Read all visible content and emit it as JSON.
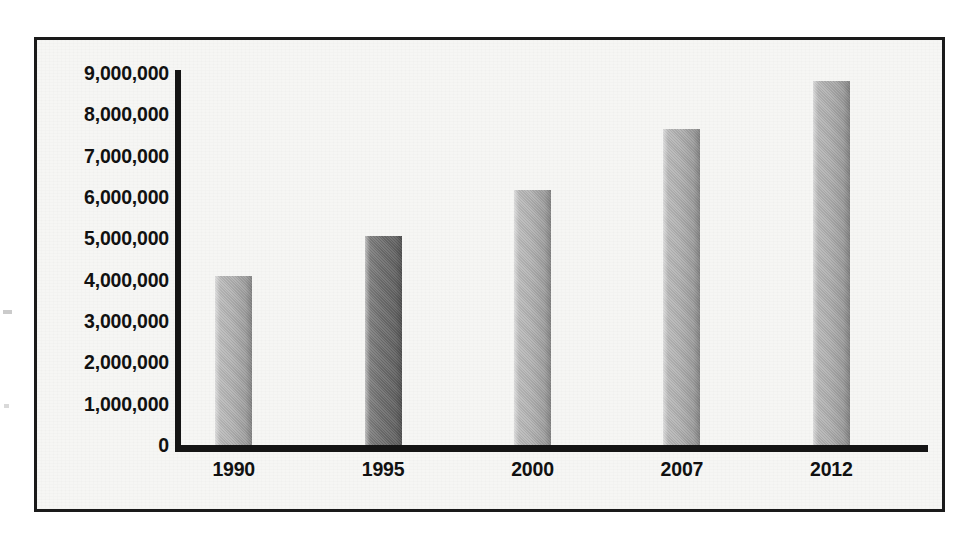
{
  "chart_data": {
    "type": "bar",
    "title": "",
    "subtitle": "",
    "xlabel": "",
    "ylabel": "",
    "categories": [
      "1990",
      "1995",
      "2000",
      "2007",
      "2012"
    ],
    "values": [
      4100000,
      5050000,
      6180000,
      7650000,
      8800000
    ],
    "series": [
      {
        "name": "",
        "values": [
          4100000,
          5050000,
          6180000,
          7650000,
          8800000
        ]
      }
    ],
    "bar_colors": [
      "#b2b2b2",
      "#6e6e6e",
      "#b2b2b2",
      "#b0b0b0",
      "#aeaeae"
    ],
    "ylim": [
      0,
      9000000
    ],
    "ytick_labels": [
      "9,000,000",
      "8,000,000",
      "7,000,000",
      "6,000,000",
      "5,000,000",
      "4,000,000",
      "3,000,000",
      "2,000,000",
      "1,000,000",
      "0"
    ],
    "ytick_values": [
      9000000,
      8000000,
      7000000,
      6000000,
      5000000,
      4000000,
      3000000,
      2000000,
      1000000,
      0
    ],
    "grid": false,
    "legend": null,
    "annotations": []
  },
  "style": {
    "frame_border_color": "#1a1a1a",
    "plot_background": "#f6f6f4",
    "axis_color": "#151515",
    "label_color": "#111111",
    "page_background": "#ffffff"
  }
}
